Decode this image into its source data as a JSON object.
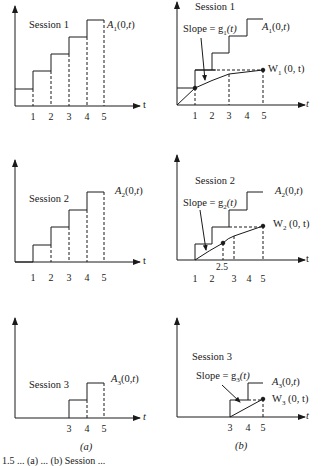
{
  "figure": {
    "panel_labels": {
      "a": "(a)",
      "b": "(b)"
    },
    "caption_fragment": "1.5 ... (a) ... (b) Session ..."
  },
  "axis": {
    "x_label": "t"
  },
  "panels_a": [
    {
      "session": "Session 1",
      "curve_label": "A",
      "curve_sub": "1",
      "curve_args": "(0,",
      "curve_t": "t",
      "curve_close": ")",
      "ticks": [
        "1",
        "2",
        "3",
        "4",
        "5"
      ]
    },
    {
      "session": "Session 2",
      "curve_label": "A",
      "curve_sub": "2",
      "curve_args": "(0,",
      "curve_t": "t",
      "curve_close": ")",
      "ticks": [
        "1",
        "2",
        "3",
        "4",
        "5"
      ]
    },
    {
      "session": "Session 3",
      "curve_label": "A",
      "curve_sub": "3",
      "curve_args": "(0,",
      "curve_t": "t",
      "curve_close": ")",
      "ticks": [
        "3",
        "4",
        "5"
      ]
    }
  ],
  "panels_b": [
    {
      "session": "Session 1",
      "slope_text": "Slope = g",
      "slope_sub": "1",
      "slope_arg": "(t)",
      "a_label": "A",
      "a_sub": "1",
      "a_args": "(0,",
      "a_t": "t",
      "a_close": ")",
      "w_label": "W",
      "w_sub": "1",
      "w_args": "(0, t)",
      "ticks": [
        "1",
        "2",
        "3",
        "4",
        "5"
      ]
    },
    {
      "session": "Session 2",
      "slope_text": "Slope = g",
      "slope_sub": "2",
      "slope_arg": "(t)",
      "a_label": "A",
      "a_sub": "2",
      "a_args": "(0,",
      "a_t": "t",
      "a_close": ")",
      "w_label": "W",
      "w_sub": "2",
      "w_args": "(0, t)",
      "ticks": [
        "1",
        "2",
        "3",
        "4",
        "5"
      ],
      "extra_tick": "2.5"
    },
    {
      "session": "Session 3",
      "slope_text": "Slope = g",
      "slope_sub": "3",
      "slope_arg": "(t)",
      "a_label": "A",
      "a_sub": "3",
      "a_args": "(0,",
      "a_t": "t",
      "a_close": ")",
      "w_label": "W",
      "w_sub": "3",
      "w_args": "(0, t)",
      "ticks": [
        "3",
        "4",
        "5"
      ]
    }
  ],
  "colors": {
    "ink": "#1a1a1a",
    "background": "#ffffff"
  }
}
